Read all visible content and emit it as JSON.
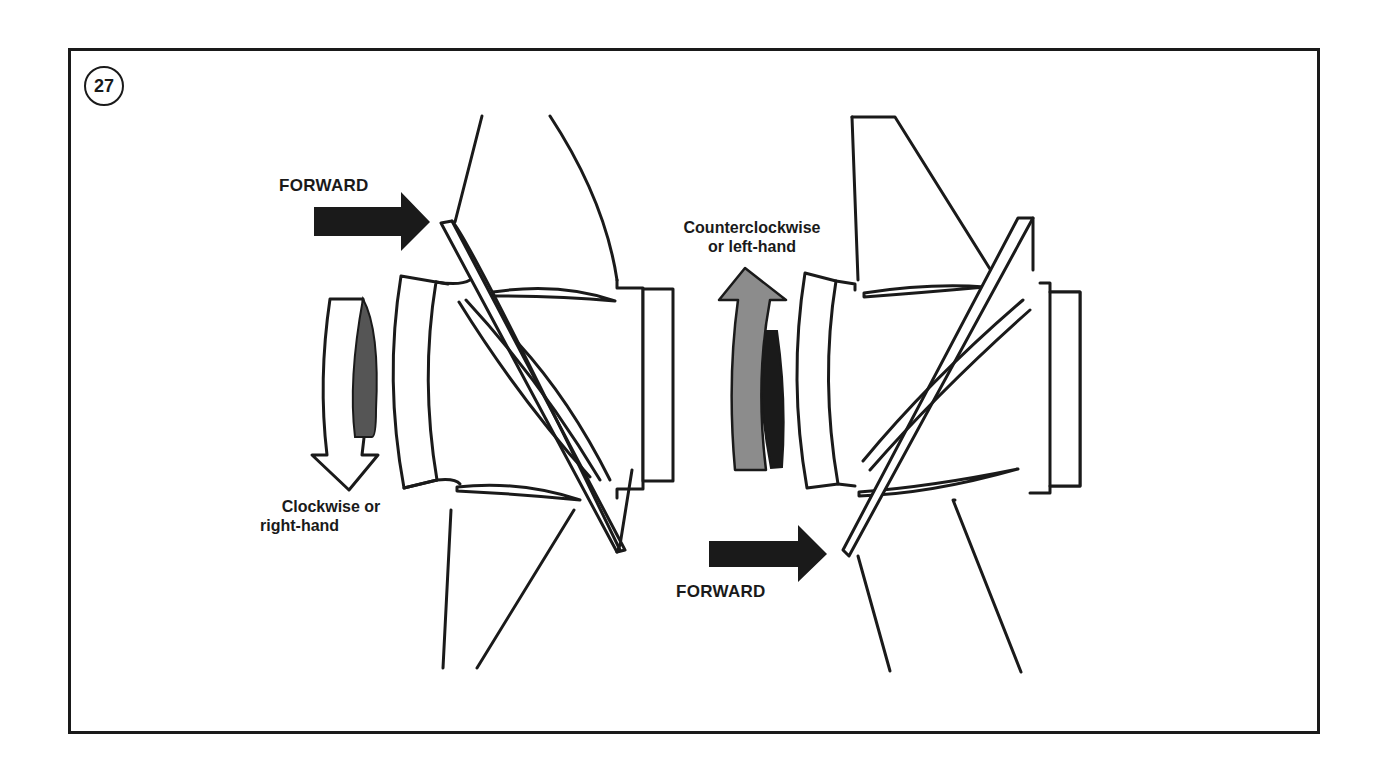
{
  "figure": {
    "number": "27",
    "colors": {
      "line": "#1a1a1a",
      "arrow_dark": "#1a1a1a",
      "arrow_gray": "#8c8c8c",
      "shade_dark": "#555555",
      "background": "#ffffff"
    }
  },
  "left_propeller": {
    "forward_label": "FORWARD",
    "rotation_label_line1": "Clockwise or",
    "rotation_label_line2": "right-hand",
    "rotation_direction": "clockwise"
  },
  "right_propeller": {
    "forward_label": "FORWARD",
    "rotation_label_line1": "Counterclockwise",
    "rotation_label_line2": "or left-hand",
    "rotation_direction": "counterclockwise"
  }
}
